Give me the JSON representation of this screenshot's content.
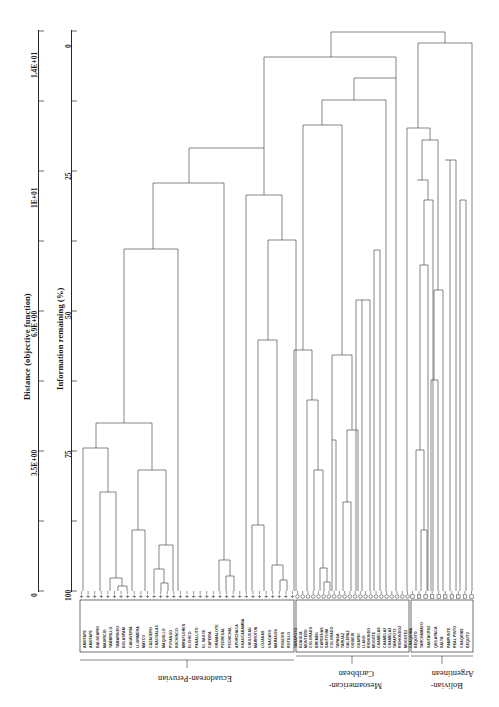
{
  "figure": {
    "type": "dendrogram",
    "orientation": "top-down",
    "distance_axis": {
      "title": "Distance (objective function)",
      "ticks": [
        "0",
        "3.5E+00",
        "6.9E+00",
        "1E+01",
        "1.4E+01"
      ],
      "tick_values": [
        0,
        3.5,
        6.9,
        10,
        14
      ],
      "direction": "bottom-to-top"
    },
    "information_axis": {
      "title": "Information remaining (%)",
      "ticks": [
        "100",
        "75",
        "50",
        "25",
        "0"
      ],
      "tick_values": [
        100,
        75,
        50,
        25,
        0
      ],
      "minor_ticks": [
        87.5,
        62.5,
        37.5,
        12.5
      ],
      "direction": "bottom-to-top"
    }
  },
  "groups": [
    {
      "id": "ecuadorean-peruvian",
      "label": "Ecuadorean-Peruvian",
      "symbol": "plus",
      "n": 33
    },
    {
      "id": "mesoamerican-caribbean",
      "label": "Mesoamerican-\nCaribbean",
      "symbol": "circle",
      "n": 22
    },
    {
      "id": "bolivian-argentinean",
      "label": "Bolivian-\nArgentinean",
      "symbol": "square",
      "n": 10
    }
  ],
  "group_labels": {
    "ecuadorean_peruvian": "Ecuadorean-Peruvian",
    "mesoamerican_l1": "Mesoamerican-",
    "mesoamerican_l2": "Caribbean",
    "bolivian_l1": "Bolivian-",
    "bolivian_l2": "Argentinean"
  },
  "taxa": [
    "AMOTAPE",
    "AMOTAPE",
    "BALNEARIO",
    "MAURICIO",
    "TAMBRILLO",
    "TAMARINDO",
    "BOLASPAM",
    "CANAVERIA",
    "LLORIMERA",
    "MAYCU",
    "CAZADERO",
    "CHACHALAC",
    "MAQUILLO",
    "PUYANGO",
    "BUCHINCO",
    "MIRAFLORES",
    "ELCHICO",
    "PASALLITO",
    "EL SAUCE",
    "CAPEIRA",
    "GRAMALOTE",
    "PEDREGAL",
    "PECHICHAL",
    "APORCHACA",
    "HUANCABAMBA",
    "CHULUCAN",
    "MARROTON",
    "LOJANAS",
    "UNAGAYO",
    "MARANON",
    "RONDOS",
    "ROTILLO",
    "TARAPOTO",
    "BIJAGUA",
    "MONTERO",
    "COLORADO",
    "BREMEN",
    "CARDENAS",
    "SANTIYUM",
    "COLORADO",
    "TAPANA",
    "TARIJAZ",
    "GALERAZ",
    "GUIBEIS",
    "GUARDI",
    "LLANO",
    "RIOHONDO",
    "MOGOTE",
    "CHAMELAS",
    "CHAMELA2",
    "CHAMELA3",
    "TARAPOT2",
    "RIOHONDO2",
    "MOGOTE2",
    "CHAQUIMA",
    "BEQUITO",
    "TARCHAMAYO",
    "SANTACRUZ",
    "QUILAPACA",
    "SALTA",
    "PAMPUNTE",
    "REAL PINTO",
    "CHAQUIM2",
    "BEQUIT2"
  ],
  "colors": {
    "line": "#3a3a3a",
    "axis": "#262626",
    "background": "#ffffff",
    "text": "#1a1a1a"
  }
}
